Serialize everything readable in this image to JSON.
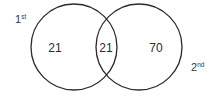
{
  "diagram": {
    "type": "venn",
    "sets": [
      {
        "id": "first",
        "label_main": "1",
        "label_sup": "st"
      },
      {
        "id": "second",
        "label_main": "2",
        "label_sup": "nd"
      }
    ],
    "regions": {
      "first_only": "21",
      "intersection": "21",
      "second_only": "70"
    },
    "colors": {
      "stroke": "#2a2a2a",
      "text": "#2c2c2c",
      "background": "#ffffff"
    }
  }
}
